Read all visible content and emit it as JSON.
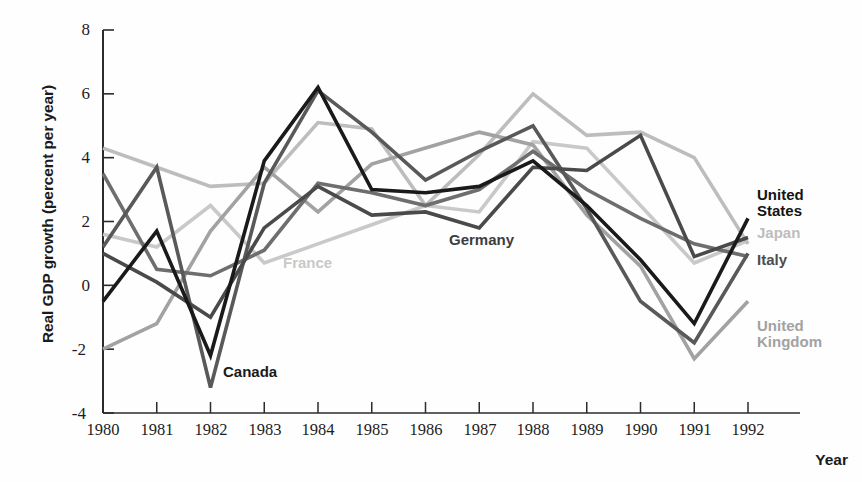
{
  "chart_data": {
    "type": "line",
    "title": "",
    "xlabel": "Year",
    "ylabel": "Real GDP growth (percent per year)",
    "xlim": [
      1980,
      1992
    ],
    "ylim": [
      -4,
      8
    ],
    "yticks": [
      -4,
      -2,
      0,
      2,
      4,
      6,
      8
    ],
    "grid": false,
    "legend_position": "inline-right",
    "x": [
      1980,
      1981,
      1982,
      1983,
      1984,
      1985,
      1986,
      1987,
      1988,
      1989,
      1990,
      1991,
      1992
    ],
    "series": [
      {
        "name": "United States",
        "color": "#1a1a1a",
        "label_position": "right",
        "values": [
          -0.5,
          1.7,
          -2.2,
          3.9,
          6.2,
          3.0,
          2.9,
          3.1,
          3.9,
          2.5,
          0.8,
          -1.2,
          2.1
        ]
      },
      {
        "name": "Japan",
        "color": "#bdbdbd",
        "label_position": "right",
        "values": [
          4.3,
          3.7,
          3.1,
          3.2,
          5.1,
          4.9,
          2.5,
          4.1,
          6.0,
          4.7,
          4.8,
          4.0,
          1.3
        ]
      },
      {
        "name": "Germany",
        "color": "#4a4a4a",
        "label_position": "inline",
        "values": [
          1.0,
          0.1,
          -1.0,
          1.8,
          3.1,
          2.2,
          2.3,
          1.8,
          3.7,
          3.6,
          4.7,
          0.9,
          1.5
        ]
      },
      {
        "name": "France",
        "color": "#c9c9c9",
        "label_position": "inline",
        "values": [
          1.6,
          1.2,
          2.5,
          0.7,
          1.3,
          1.9,
          2.5,
          2.3,
          4.5,
          4.3,
          2.5,
          0.7,
          1.4
        ]
      },
      {
        "name": "Italy",
        "color": "#6e6e6e",
        "label_position": "right",
        "values": [
          3.5,
          0.5,
          0.3,
          1.1,
          3.2,
          2.9,
          2.5,
          3.0,
          4.2,
          3.0,
          2.1,
          1.3,
          0.9
        ]
      },
      {
        "name": "United Kingdom",
        "color": "#a2a2a2",
        "label_position": "right",
        "values": [
          -2.0,
          -1.2,
          1.7,
          3.7,
          2.3,
          3.8,
          4.3,
          4.8,
          4.4,
          2.2,
          0.6,
          -2.3,
          -0.5
        ]
      },
      {
        "name": "Canada",
        "color": "#595959",
        "label_position": "inline",
        "values": [
          1.2,
          3.7,
          -3.2,
          3.2,
          6.1,
          4.8,
          3.3,
          4.2,
          5.0,
          2.4,
          -0.5,
          -1.8,
          1.0
        ]
      }
    ]
  },
  "axis": {
    "y_title": "Real GDP growth (percent per year)",
    "x_title": "Year",
    "y_tick_labels": [
      "8",
      "6",
      "4",
      "2",
      "0",
      "-2",
      "-4"
    ],
    "x_tick_labels": [
      "1980",
      "1981",
      "1982",
      "1983",
      "1984",
      "1985",
      "1986",
      "1987",
      "1988",
      "1989",
      "1990",
      "1991",
      "1992"
    ]
  },
  "labels": {
    "united_states": "United\nStates",
    "japan": "Japan",
    "italy": "Italy",
    "united_kingdom": "United\nKingdom",
    "germany": "Germany",
    "france": "France",
    "canada": "Canada"
  },
  "colors": {
    "united_states": "#1a1a1a",
    "japan": "#bdbdbd",
    "italy": "#6e6e6e",
    "united_kingdom": "#a2a2a2",
    "germany": "#4a4a4a",
    "france": "#c9c9c9",
    "canada": "#595959",
    "axis": "#2b2b2b"
  }
}
